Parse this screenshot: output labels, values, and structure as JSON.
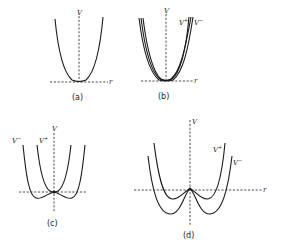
{
  "figure": {
    "panels": [
      {
        "id": "a",
        "caption": "(a)",
        "axis_labels": {
          "vertical": "V",
          "horizontal": "r"
        },
        "curves": [
          {
            "label": "",
            "shape": "single-well parabola, minimum on r axis"
          }
        ]
      },
      {
        "id": "b",
        "caption": "(b)",
        "axis_labels": {
          "vertical": "V",
          "horizontal": "r"
        },
        "curves": [
          {
            "label": "V",
            "superscript": "+",
            "shape": "narrow single well"
          },
          {
            "label": "V",
            "superscript": "−",
            "shape": "slightly wider single well"
          }
        ]
      },
      {
        "id": "c",
        "caption": "(c)",
        "axis_labels": {
          "vertical": "V",
          "horizontal": ""
        },
        "curves": [
          {
            "label": "V",
            "superscript": "−",
            "shape": "double well, shallow minima below r axis"
          },
          {
            "label": "V",
            "superscript": "+",
            "shape": "single well, minimum on r axis"
          }
        ]
      },
      {
        "id": "d",
        "caption": "(d)",
        "axis_labels": {
          "vertical": "V",
          "horizontal": "r"
        },
        "curves": [
          {
            "label": "V",
            "superscript": "+",
            "shape": "double well, shallow minima"
          },
          {
            "label": "V",
            "superscript": "−",
            "shape": "double well, deeper minima"
          }
        ]
      }
    ]
  }
}
